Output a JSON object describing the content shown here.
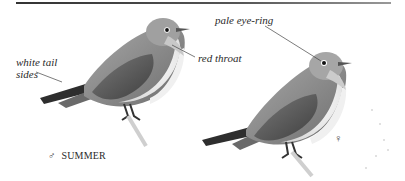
{
  "page": {
    "type": "field-guide-illustration",
    "colors": {
      "rule": "#444444",
      "bird_back": "#8a8a8a",
      "bird_belly": "#f2f2f2",
      "text": "#2a2a2a"
    }
  },
  "annotations": {
    "white_tail_sides": {
      "line1": "white tail",
      "line2": "sides"
    },
    "red_throat": "red throat",
    "pale_eye_ring": "pale eye-ring"
  },
  "figures": {
    "male": {
      "caption_symbol": "♂",
      "caption": "SUMMER"
    },
    "female": {
      "symbol": "♀"
    }
  }
}
